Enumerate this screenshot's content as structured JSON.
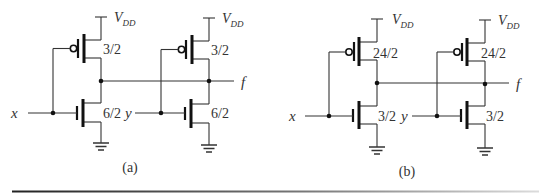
{
  "figure": {
    "panels": [
      {
        "id": "a",
        "caption": "(a)",
        "supply_label": {
          "main": "V",
          "sub": "DD"
        },
        "inputs": [
          "x",
          "y"
        ],
        "output": "f",
        "gates": [
          {
            "input": "x",
            "pmos_size": "3/2",
            "nmos_size": "6/2"
          },
          {
            "input": "y",
            "pmos_size": "3/2",
            "nmos_size": "6/2"
          }
        ]
      },
      {
        "id": "b",
        "caption": "(b)",
        "supply_label": {
          "main": "V",
          "sub": "DD"
        },
        "inputs": [
          "x",
          "y"
        ],
        "output": "f",
        "gates": [
          {
            "input": "x",
            "pmos_size": "24/2",
            "nmos_size": "3/2"
          },
          {
            "input": "y",
            "pmos_size": "24/2",
            "nmos_size": "3/2"
          }
        ]
      }
    ],
    "colors": {
      "ink": "#111111",
      "wire": "#333333",
      "background": "#ffffff",
      "rule_start": "#222222",
      "rule_end": "#d8d8d8"
    }
  }
}
